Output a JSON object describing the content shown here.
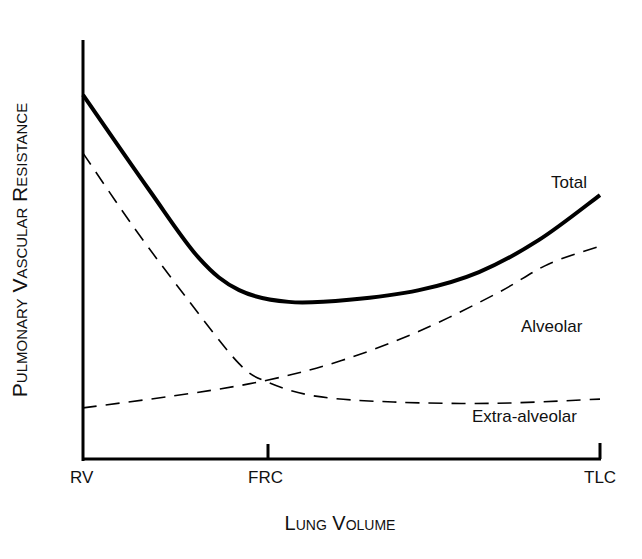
{
  "chart_data": {
    "type": "line",
    "title": "",
    "xlabel": "Lung Volume",
    "ylabel": "Pulmonary Vascular Resistance",
    "x_ticks": [
      {
        "label": "RV",
        "x": 0
      },
      {
        "label": "FRC",
        "x": 35.6
      },
      {
        "label": "TLC",
        "x": 100
      }
    ],
    "xlim": [
      0,
      100
    ],
    "ylim": [
      0,
      100
    ],
    "grid": false,
    "legend": "inline labels",
    "series": [
      {
        "name": "Total",
        "style": "solid-thick",
        "x": [
          0,
          12.8,
          22.4,
          30.2,
          39.8,
          51.5,
          65.0,
          76.6,
          88.2,
          100
        ],
        "values": [
          86.9,
          64.2,
          48.0,
          40.3,
          37.5,
          38.0,
          40.3,
          44.6,
          52.3,
          63.0
        ]
      },
      {
        "name": "Alveolar",
        "style": "dashed",
        "x": [
          0,
          20,
          35.6,
          50,
          65,
          80,
          90,
          100
        ],
        "values": [
          12.2,
          15.5,
          18.8,
          23.5,
          30.5,
          39.5,
          46.5,
          50.8
        ]
      },
      {
        "name": "Extra-alveolar",
        "style": "dashed",
        "x": [
          0,
          10,
          20,
          30,
          35.6,
          45,
          60,
          80,
          100
        ],
        "values": [
          73.0,
          55.0,
          38.5,
          23.0,
          18.4,
          15.0,
          13.6,
          13.3,
          14.3
        ]
      }
    ]
  },
  "labels": {
    "total": "Total",
    "alveolar": "Alveolar",
    "extra_alveolar": "Extra-alveolar",
    "rv": "RV",
    "frc": "FRC",
    "tlc": "TLC",
    "xaxis": "Lung Volume",
    "yaxis": "Pulmonary Vascular Resistance"
  }
}
